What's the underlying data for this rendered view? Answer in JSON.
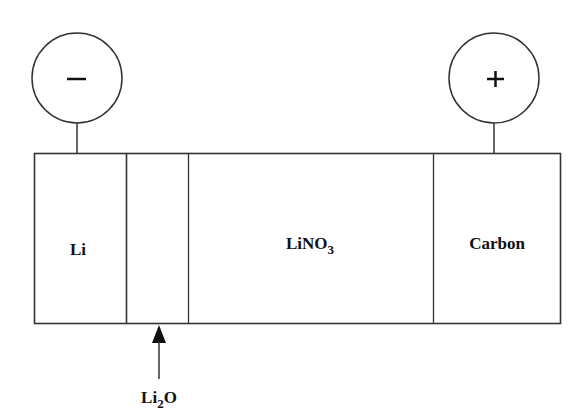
{
  "terminals": {
    "negative": {
      "symbol": "−",
      "label": "negative-terminal"
    },
    "positive": {
      "symbol": "+",
      "label": "positive-terminal"
    }
  },
  "layers": [
    {
      "id": "li",
      "text": "Li",
      "sub": ""
    },
    {
      "id": "li2o",
      "text": "",
      "sub": ""
    },
    {
      "id": "lino3",
      "text": "LiNO",
      "sub": "3"
    },
    {
      "id": "carbon",
      "text": "Carbon",
      "sub": ""
    }
  ],
  "callout": {
    "text": "Li",
    "sub": "2",
    "suffix": "O"
  },
  "colors": {
    "line": "#333333",
    "text": "#111111",
    "background": "#ffffff"
  }
}
